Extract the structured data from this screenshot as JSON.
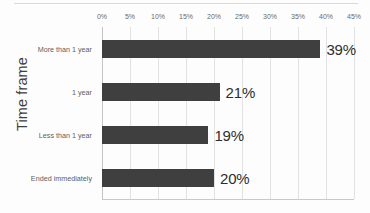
{
  "chart_data": {
    "type": "bar",
    "orientation": "horizontal",
    "title": "",
    "xlabel": "",
    "ylabel": "Time frame",
    "categories": [
      "More than 1 year",
      "1 year",
      "Less than 1 year",
      "Ended immediately"
    ],
    "values": [
      39,
      21,
      19,
      20
    ],
    "data_labels": [
      "39%",
      "21%",
      "19%",
      "20%"
    ],
    "xticks": [
      "0%",
      "5%",
      "10%",
      "15%",
      "20%",
      "25%",
      "30%",
      "35%",
      "40%",
      "45%"
    ],
    "xtick_values": [
      0,
      5,
      10,
      15,
      20,
      25,
      30,
      35,
      40,
      45
    ],
    "xlim": [
      0,
      45
    ],
    "grid": true,
    "legend": "none",
    "bar_color": "#3f3f3f",
    "gridline_color": "#e2e2e2",
    "background_color": "#fdfdfd"
  }
}
